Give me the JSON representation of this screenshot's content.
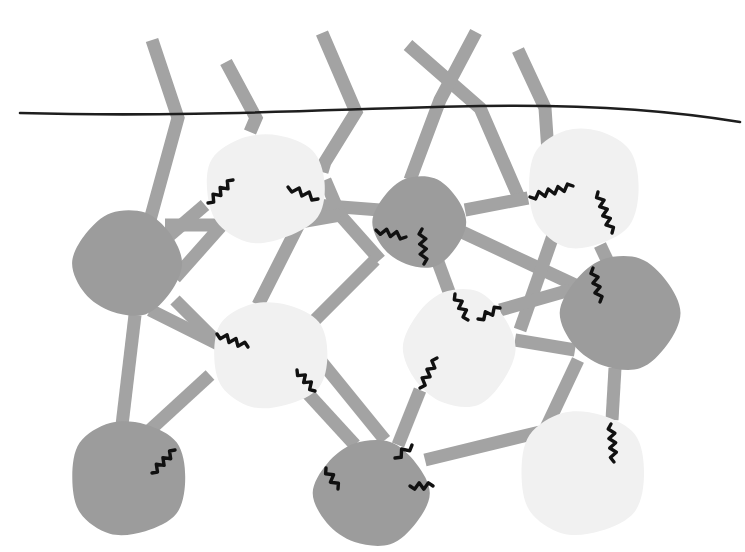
{
  "canvas": {
    "width": 745,
    "height": 552,
    "background": "#ffffff"
  },
  "colors": {
    "dark_node": "#9c9c9c",
    "light_node": "#f1f1f1",
    "rod": "#a3a3a3",
    "bond": "#111111",
    "membrane": "#1e1e1e"
  },
  "membrane": {
    "path": "M20,113 C200,118 350,108 480,106 C600,104 680,112 740,122",
    "width": 2.6
  },
  "rod_width": 13,
  "rods": [
    {
      "id": "strand-1",
      "points": "152,40 178,118 150,220"
    },
    {
      "id": "strand-2",
      "points": "226,62 256,118 250,132"
    },
    {
      "id": "strand-3",
      "points": "322,33 356,112 325,162 322,172"
    },
    {
      "id": "strand-4a",
      "points": "408,45 480,108 520,200"
    },
    {
      "id": "strand-4b",
      "points": "476,32 440,100 410,180"
    },
    {
      "id": "strand-5",
      "points": "518,50 545,108 548,152"
    },
    {
      "id": "d1-l1a",
      "points": "170,235 205,205"
    },
    {
      "id": "d1-l1b",
      "points": "165,225 222,225 175,278"
    },
    {
      "id": "d1-l3a",
      "points": "175,300 215,340"
    },
    {
      "id": "d1-l3b",
      "points": "150,310 220,345"
    },
    {
      "id": "d1-d4",
      "points": "135,315 122,425"
    },
    {
      "id": "l3-d4",
      "points": "210,375 150,430"
    },
    {
      "id": "l1-d2a",
      "points": "315,205 380,210"
    },
    {
      "id": "l1-d2b",
      "points": "325,180 340,215 380,260"
    },
    {
      "id": "l1-l3",
      "points": "340,215 300,222 258,305"
    },
    {
      "id": "d2-l3",
      "points": "375,260 310,325"
    },
    {
      "id": "d2-l2",
      "points": "465,210 528,198"
    },
    {
      "id": "d2-d3",
      "points": "462,232 575,285"
    },
    {
      "id": "d2-l4",
      "points": "438,262 452,300"
    },
    {
      "id": "l2-d3",
      "points": "600,245 608,262"
    },
    {
      "id": "l2-l4",
      "points": "555,230 520,330"
    },
    {
      "id": "l4-d3a",
      "points": "500,310 570,290"
    },
    {
      "id": "l4-d3b",
      "points": "515,340 575,350"
    },
    {
      "id": "d3-l5a",
      "points": "615,368 612,420"
    },
    {
      "id": "d3-l5b",
      "points": "578,360 545,430"
    },
    {
      "id": "l3-d5a",
      "points": "300,385 355,445"
    },
    {
      "id": "l3-d5b",
      "points": "320,360 385,440"
    },
    {
      "id": "l4-d5",
      "points": "420,390 398,445"
    },
    {
      "id": "d5-l5",
      "points": "425,460 540,432"
    }
  ],
  "nodes": [
    {
      "id": "D1",
      "kind": "dark",
      "cx": 128,
      "cy": 263,
      "rx": 54,
      "ry": 52,
      "rot": 0
    },
    {
      "id": "L1",
      "kind": "light",
      "cx": 265,
      "cy": 188,
      "rx": 60,
      "ry": 55,
      "rot": -5
    },
    {
      "id": "D2",
      "kind": "dark",
      "cx": 420,
      "cy": 222,
      "rx": 46,
      "ry": 45,
      "rot": 0
    },
    {
      "id": "L2",
      "kind": "light",
      "cx": 583,
      "cy": 188,
      "rx": 56,
      "ry": 61,
      "rot": 0
    },
    {
      "id": "D3",
      "kind": "dark",
      "cx": 621,
      "cy": 313,
      "rx": 59,
      "ry": 56,
      "rot": 0
    },
    {
      "id": "L3",
      "kind": "light",
      "cx": 270,
      "cy": 355,
      "rx": 58,
      "ry": 54,
      "rot": 0
    },
    {
      "id": "L4",
      "kind": "light",
      "cx": 460,
      "cy": 348,
      "rx": 55,
      "ry": 58,
      "rot": 0
    },
    {
      "id": "D4",
      "kind": "dark",
      "cx": 128,
      "cy": 478,
      "rx": 58,
      "ry": 58,
      "rot": 0
    },
    {
      "id": "D5",
      "kind": "dark",
      "cx": 372,
      "cy": 493,
      "rx": 57,
      "ry": 52,
      "rot": 0
    },
    {
      "id": "L5",
      "kind": "light",
      "cx": 582,
      "cy": 473,
      "rx": 63,
      "ry": 63,
      "rot": 0
    }
  ],
  "bonds": [
    {
      "id": "b-l1-left",
      "x1": 208,
      "y1": 203,
      "x2": 233,
      "y2": 180
    },
    {
      "id": "b-l1-right",
      "x1": 288,
      "y1": 187,
      "x2": 318,
      "y2": 199
    },
    {
      "id": "b-d2-left",
      "x1": 376,
      "y1": 230,
      "x2": 406,
      "y2": 237
    },
    {
      "id": "b-d2-down",
      "x1": 422,
      "y1": 229,
      "x2": 424,
      "y2": 264
    },
    {
      "id": "b-l2-left",
      "x1": 530,
      "y1": 197,
      "x2": 573,
      "y2": 186
    },
    {
      "id": "b-l2-down",
      "x1": 598,
      "y1": 192,
      "x2": 612,
      "y2": 233
    },
    {
      "id": "b-d3-top",
      "x1": 593,
      "y1": 268,
      "x2": 600,
      "y2": 302
    },
    {
      "id": "b-l4-topa",
      "x1": 455,
      "y1": 294,
      "x2": 468,
      "y2": 320
    },
    {
      "id": "b-l4-topb",
      "x1": 478,
      "y1": 319,
      "x2": 500,
      "y2": 308
    },
    {
      "id": "b-l4-left",
      "x1": 420,
      "y1": 388,
      "x2": 437,
      "y2": 358
    },
    {
      "id": "b-l3-left",
      "x1": 217,
      "y1": 334,
      "x2": 248,
      "y2": 347
    },
    {
      "id": "b-l3-right",
      "x1": 297,
      "y1": 370,
      "x2": 315,
      "y2": 391
    },
    {
      "id": "b-d4",
      "x1": 152,
      "y1": 473,
      "x2": 175,
      "y2": 450
    },
    {
      "id": "b-d5-left",
      "x1": 326,
      "y1": 468,
      "x2": 338,
      "y2": 489
    },
    {
      "id": "b-d5-top",
      "x1": 395,
      "y1": 458,
      "x2": 412,
      "y2": 445
    },
    {
      "id": "b-d5-right",
      "x1": 410,
      "y1": 486,
      "x2": 433,
      "y2": 486
    },
    {
      "id": "b-l5",
      "x1": 611,
      "y1": 424,
      "x2": 614,
      "y2": 462
    }
  ]
}
